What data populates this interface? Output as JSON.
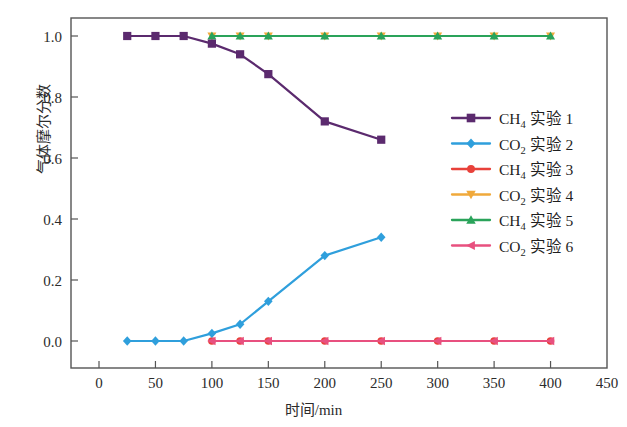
{
  "chart_data": {
    "type": "line",
    "title": "",
    "xlabel": "时间/min",
    "ylabel": "气体摩尔分数",
    "xlim": [
      0,
      450
    ],
    "ylim": [
      0.0,
      1.0
    ],
    "xticks": [
      "0",
      "50",
      "100",
      "150",
      "200",
      "250",
      "300",
      "350",
      "400",
      "450"
    ],
    "yticks": [
      "0.0",
      "0.2",
      "0.4",
      "0.6",
      "0.8",
      "1.0"
    ],
    "xtick_values": [
      0,
      50,
      100,
      150,
      200,
      250,
      300,
      350,
      400,
      450
    ],
    "ytick_values": [
      0.0,
      0.2,
      0.4,
      0.6,
      0.8,
      1.0
    ],
    "grid": false,
    "legend_position": "center-right",
    "series": [
      {
        "name": "CH₄ 实验 1",
        "species": "CH4",
        "run": "实验 1",
        "color": "#5b2a6e",
        "marker": "square",
        "x": [
          25,
          50,
          75,
          100,
          125,
          150,
          200,
          250
        ],
        "values": [
          1.0,
          1.0,
          1.0,
          0.975,
          0.94,
          0.875,
          0.72,
          0.66
        ]
      },
      {
        "name": "CO₂ 实验 2",
        "species": "CO2",
        "run": "实验 2",
        "color": "#2f9fdc",
        "marker": "diamond",
        "x": [
          25,
          50,
          75,
          100,
          125,
          150,
          200,
          250
        ],
        "values": [
          0.0,
          0.0,
          0.0,
          0.025,
          0.055,
          0.13,
          0.28,
          0.34
        ]
      },
      {
        "name": "CH₄ 实验 3",
        "species": "CH4",
        "run": "实验 3",
        "color": "#e8413a",
        "marker": "circle",
        "x": [
          100,
          125,
          150,
          200,
          250,
          300,
          350,
          400
        ],
        "values": [
          0.0,
          0.0,
          0.0,
          0.0,
          0.0,
          0.0,
          0.0,
          0.0
        ]
      },
      {
        "name": "CO₂ 实验 4",
        "species": "CO2",
        "run": "实验 4",
        "color": "#f0a93b",
        "marker": "triangle-down",
        "x": [
          100,
          125,
          150,
          200,
          250,
          300,
          350,
          400
        ],
        "values": [
          1.0,
          1.0,
          1.0,
          1.0,
          1.0,
          1.0,
          1.0,
          1.0
        ]
      },
      {
        "name": "CH₄ 实验 5",
        "species": "CH4",
        "run": "实验 5",
        "color": "#2aa35a",
        "marker": "triangle-up",
        "x": [
          100,
          125,
          150,
          200,
          250,
          300,
          350,
          400
        ],
        "values": [
          1.0,
          1.0,
          1.0,
          1.0,
          1.0,
          1.0,
          1.0,
          1.0
        ]
      },
      {
        "name": "CO₂ 实验 6",
        "species": "CO2",
        "run": "实验 6",
        "color": "#e8507f",
        "marker": "triangle-left",
        "x": [
          100,
          125,
          150,
          200,
          250,
          300,
          350,
          400
        ],
        "values": [
          0.0,
          0.0,
          0.0,
          0.0,
          0.0,
          0.0,
          0.0,
          0.0
        ]
      }
    ]
  },
  "axes": {
    "x_label": "时间/min",
    "y_label": "气体摩尔分数"
  },
  "legend": {
    "entries": [
      {
        "label": "CH₄ 实验 1",
        "base": "CH",
        "sub": "4",
        "rest": " 实验 1",
        "color": "#5b2a6e",
        "marker": "square"
      },
      {
        "label": "CO₂ 实验 2",
        "base": "CO",
        "sub": "2",
        "rest": " 实验 2",
        "color": "#2f9fdc",
        "marker": "diamond"
      },
      {
        "label": "CH₄ 实验 3",
        "base": "CH",
        "sub": "4",
        "rest": " 实验 3",
        "color": "#e8413a",
        "marker": "circle"
      },
      {
        "label": "CO₂ 实验 4",
        "base": "CO",
        "sub": "2",
        "rest": " 实验 4",
        "color": "#f0a93b",
        "marker": "triangle-down"
      },
      {
        "label": "CH₄ 实验 5",
        "base": "CH",
        "sub": "4",
        "rest": " 实验 5",
        "color": "#2aa35a",
        "marker": "triangle-up"
      },
      {
        "label": "CO₂ 实验 6",
        "base": "CO",
        "sub": "2",
        "rest": " 实验 6",
        "color": "#e8507f",
        "marker": "triangle-left"
      }
    ]
  },
  "frame": {
    "border_color": "#555555",
    "background": "#ffffff"
  }
}
